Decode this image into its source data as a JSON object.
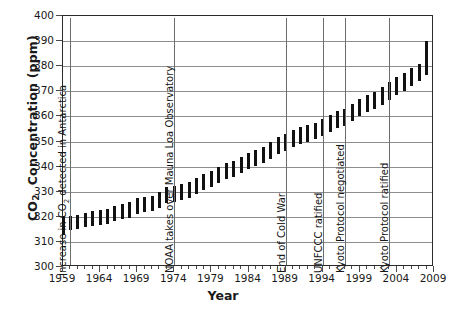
{
  "chart_data": {
    "type": "bar",
    "title": "",
    "xlabel": "Year",
    "ylabel": "CO2  Concentration (ppm)",
    "ylabel_parts": {
      "prefix": "CO",
      "sub": "2",
      "suffix": " Concentration (ppm)"
    },
    "xlim": [
      1959,
      2009
    ],
    "ylim": [
      300,
      400
    ],
    "ytick_labels": [
      "300",
      "310",
      "320",
      "330",
      "340",
      "350",
      "360",
      "370",
      "380",
      "390",
      "400"
    ],
    "ytick_values": [
      300,
      310,
      320,
      330,
      340,
      350,
      360,
      370,
      380,
      390,
      400
    ],
    "xtick_labels": [
      "1959",
      "1964",
      "1969",
      "1974",
      "1979",
      "1984",
      "1989",
      "1994",
      "1999",
      "2004",
      "2009"
    ],
    "xtick_values": [
      1959,
      1964,
      1969,
      1974,
      1979,
      1984,
      1989,
      1994,
      1999,
      2004,
      2009
    ],
    "grid": "horizontal",
    "legend": "none",
    "bar_color": "#111111",
    "series_note": "Each vertical bar spans the annual minimum to maximum CO2 concentration",
    "years": [
      1959,
      1960,
      1961,
      1962,
      1963,
      1964,
      1965,
      1966,
      1967,
      1968,
      1969,
      1970,
      1971,
      1972,
      1973,
      1974,
      1975,
      1976,
      1977,
      1978,
      1979,
      1980,
      1981,
      1982,
      1983,
      1984,
      1985,
      1986,
      1987,
      1988,
      1989,
      1990,
      1991,
      1992,
      1993,
      1994,
      1995,
      1996,
      1997,
      1998,
      1999,
      2000,
      2001,
      2002,
      2003,
      2004,
      2005,
      2006,
      2007,
      2008
    ],
    "low": [
      312.6,
      314.7,
      315.3,
      315.9,
      316.3,
      316.8,
      317.3,
      318.3,
      319.0,
      319.7,
      321.0,
      321.9,
      322.3,
      323.7,
      325.4,
      326.0,
      326.6,
      327.5,
      329.0,
      330.5,
      331.8,
      333.4,
      334.9,
      335.8,
      337.4,
      339.1,
      340.2,
      341.5,
      343.1,
      344.9,
      346.4,
      347.9,
      349.1,
      349.9,
      350.9,
      352.2,
      353.8,
      355.3,
      356.3,
      358.0,
      360.0,
      361.8,
      363.0,
      364.7,
      366.6,
      368.6,
      370.2,
      372.3,
      374.0,
      376.6
    ],
    "high": [
      320.2,
      320.5,
      320.9,
      321.6,
      322.2,
      322.7,
      323.2,
      324.5,
      325.1,
      325.8,
      327.3,
      328.0,
      328.4,
      330.0,
      331.8,
      332.2,
      332.9,
      333.7,
      335.5,
      337.0,
      338.3,
      340.0,
      341.3,
      342.1,
      344.0,
      345.6,
      346.7,
      348.0,
      349.8,
      351.6,
      353.0,
      354.6,
      355.7,
      356.4,
      357.4,
      358.8,
      360.5,
      362.0,
      363.0,
      365.0,
      366.9,
      368.6,
      369.9,
      371.6,
      373.6,
      375.6,
      377.2,
      379.3,
      381.0,
      390.0
    ],
    "annotations": [
      {
        "label": "Increase in CO2 detected in Antarctica",
        "year": 1960
      },
      {
        "label": "NOAA takes over Mauna Loa Observatory",
        "year": 1974
      },
      {
        "label": "End of Cold War",
        "year": 1989
      },
      {
        "label": "UNFCCC ratified",
        "year": 1994
      },
      {
        "label": "Kyoto Protocol negotiated",
        "year": 1997
      },
      {
        "label": "Kyoto Protocol ratified",
        "year": 2003
      }
    ]
  }
}
